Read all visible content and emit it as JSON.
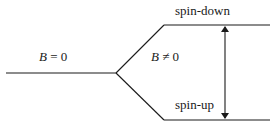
{
  "diagram": {
    "type": "energy-level-splitting",
    "colors": {
      "line": "#1a1a1a",
      "text": "#1a1a1a",
      "background": "#ffffff"
    },
    "labels": {
      "field_off": {
        "variable": "B",
        "relation": " = ",
        "value": "0"
      },
      "field_on": {
        "variable": "B",
        "relation": " ≠ ",
        "value": "0"
      },
      "upper_level": "spin-down",
      "lower_level": "spin-up"
    },
    "levels": [
      {
        "name": "degenerate-level",
        "x1": 6,
        "y1": 73,
        "x2": 116,
        "y2": 73
      },
      {
        "name": "upper-level",
        "x1": 164,
        "y1": 25,
        "x2": 270,
        "y2": 25
      },
      {
        "name": "lower-level",
        "x1": 164,
        "y1": 120,
        "x2": 270,
        "y2": 120
      }
    ],
    "splitting_lines": [
      {
        "name": "split-up-line",
        "x1": 116,
        "y1": 73,
        "x2": 164,
        "y2": 25
      },
      {
        "name": "split-down-line",
        "x1": 116,
        "y1": 73,
        "x2": 164,
        "y2": 120
      }
    ],
    "energy_gap_arrow": {
      "x": 225,
      "y_top": 26,
      "y_bottom": 119,
      "double_headed": true
    }
  }
}
